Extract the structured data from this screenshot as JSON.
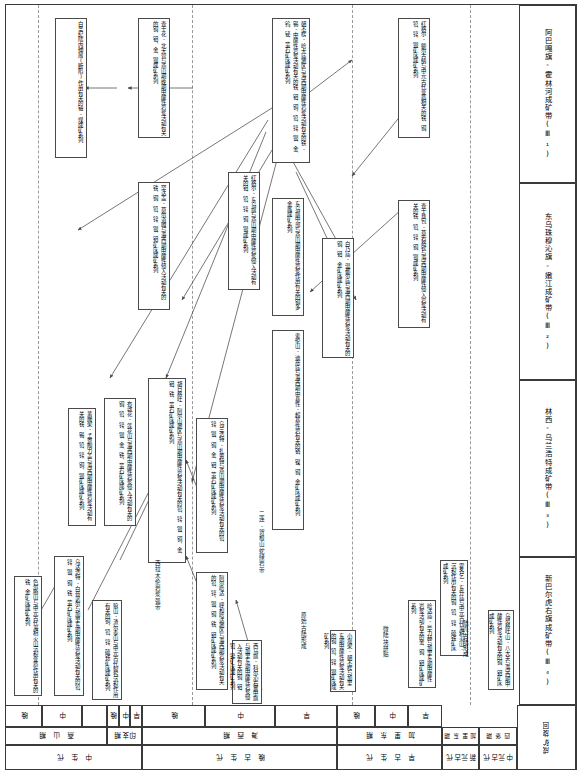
{
  "figure": {
    "kind": "metallogenic-evolution-chart",
    "orientation": "page rotated 90 degrees; body text reads vertically"
  },
  "belts": [
    {
      "id": "III-1",
      "label": "阿巴嘎旗-霍林河成矿带(Ⅲ₁)"
    },
    {
      "id": "III-2",
      "label": "东乌珠穆沁旗-嫩江成矿带(Ⅲ₂)"
    },
    {
      "id": "III-3",
      "label": "林西-乌兰浩特成矿带(Ⅲ₃)"
    },
    {
      "id": "III-4",
      "label": "新巴尔虎右旗成矿带(Ⅲ₄)"
    }
  ],
  "boxes": [
    {
      "id": "b1",
      "text": "白垩纪陆内伸展(断陷)作用有关的铀-煤成矿系列"
    },
    {
      "id": "b2",
      "text": "查干花-北大营与燕山期晚期中酸性岩浆活动有关的铜、钼、金、银成矿系列"
    },
    {
      "id": "b3",
      "text": "胡日格吐-阿尔山地区与燕山期中酸性岩浆活动有关的铅、锌、银、铜、金、钼、铁、萤石矿床成矿系列"
    },
    {
      "id": "b4",
      "text": "东乌旗中部与燕山期中酸性岩浆作用有关的铜多金属成矿系列"
    },
    {
      "id": "b5",
      "text": "红格尔-东乌旗与燕山期中酸性岩浆侵入活动有关的钼、铅、锌、铜、银成矿系列"
    },
    {
      "id": "b6",
      "text": "乌兰浩特-扎赉特与燕山期中酸性岩浆活动有关的铅、锌、银、铜、金、钼、萤石矿床成矿系列"
    },
    {
      "id": "b7",
      "text": "红格尔-额尔古纳与中元古代变质相关的铁、铜、铅、锌、银矿床成矿系列"
    },
    {
      "id": "b8",
      "text": "甲乌拉-查干布拉根与燕山期火山-次火山热液有关的铅、锌、银成矿系列"
    },
    {
      "id": "b9",
      "text": "白乃庙-温都尔庙与海西期中酸性岩浆活动有关的铜、钼、金矿床成矿系列"
    },
    {
      "id": "b10",
      "text": "索伦山-迪彦庙与海西期中基性-超基性岩有关的铬、镍、铜、金矿床成矿系列"
    },
    {
      "id": "b11",
      "text": "查干敖包-莫若格钦与海西期中酸性侵入岩浆活动有关的铁、铅、锌、铜、银成矿系列"
    },
    {
      "id": "b12",
      "text": "朝不楞-哈大庙地区与海西期中酸性岩浆活动有关的铁-锡-中酸性岩浆活动有关的铁、钼、铜、铅、锌、银、金、钨、铋、萤石矿床成矿系列"
    },
    {
      "id": "b13",
      "text": "罕达盖-莫尔道嘎与海西期中酸性侵入活动有关的铁、铜、铅、锌、银、钼矿床成矿系列"
    },
    {
      "id": "b14",
      "text": "乌努格吐山-八大关与海西期中酸性岩浆活动有关的铜、钼矿床成矿系列"
    },
    {
      "id": "b15",
      "text": "黄岗梁-孟恩陶力盖与海西期中酸性岩浆活动有关的铁、锡、铅、锌、铜、银矿床成矿系列"
    },
    {
      "id": "b16",
      "text": "布敦花-莲花山与海西期中酸性岩浆侵入活动有关的铜、铅、锌、银、金、铁、萤石矿床成矿系列"
    },
    {
      "id": "b17",
      "text": "阿尔哈达-呼和哈达地区与海西期岩浆活动有关的铅、锌、银、铜、铁、钼矿床成矿系列"
    },
    {
      "id": "b18",
      "text": "乌达浩特-白音诺尔与加里东期中酸性岩浆活动有关的铅、锌、银、铜、铁、萤石矿床成矿系列"
    },
    {
      "id": "b19",
      "text": "霍各乞-东升庙与中元古代海相火山-沉积作用有关的铜、铅、锌、硫铁矿床成矿系列"
    },
    {
      "id": "b20",
      "text": "小坝梁-朝不楞与加里东期中酸性岩浆活动有关的铜、铅、锌、银矿床成矿系列"
    },
    {
      "id": "b21",
      "text": "色尔腾山与中元古代海相火山沉积变质作用有关的铁、金矿床成矿系列"
    },
    {
      "id": "b22",
      "text": "狼山-渣尔泰山与中元古代裂谷沉积作用有关的铜、铅、锌、硫铁矿床成矿系列"
    },
    {
      "id": "b23",
      "text": "西乌旗-科尔沁右翼中旗与加里东期中酸性岩浆侵入活动有关的铜、钼、铅、锌矿床成矿系列"
    },
    {
      "id": "b24",
      "text": "哈达庙-毕力赫与加里东期中酸性岩浆活动有关的金、铜、钼矿床成矿系列"
    }
  ],
  "plain_labels": [
    {
      "id": "p1",
      "text": "二连-贺根山蛇绿岩带"
    },
    {
      "id": "p2",
      "text": "西拉木伦岩浆弧带"
    },
    {
      "id": "p3",
      "text": "微陆块拼贴"
    },
    {
      "id": "p4",
      "text": "陆壳古陆形成"
    },
    {
      "id": "p5",
      "text": "原始古陆形成"
    }
  ],
  "time_scale": {
    "row_epoch": {
      "label": "世/统",
      "cells": [
        "晚",
        "中",
        "",
        "晚",
        "中",
        "早",
        "晚",
        "中",
        "早",
        "晚",
        "中",
        "早"
      ]
    },
    "row_orogeny": {
      "label": "构造-成矿期",
      "cells": [
        "燕 山 期",
        "印支期",
        "海 西 期",
        "加 里 东 期",
        "四 堡 期"
      ]
    },
    "row_era": {
      "label": "代",
      "cells": [
        "中 生 代",
        "晚 古 生 代",
        "早 古 生 代",
        "新元古代",
        "中元古代"
      ]
    },
    "row_corner": {
      "label": "成矿旋回"
    }
  },
  "colors": {
    "line": "#3a3a3a",
    "dash": "#9a9a9a",
    "text": "#111111",
    "background": "#ffffff"
  }
}
